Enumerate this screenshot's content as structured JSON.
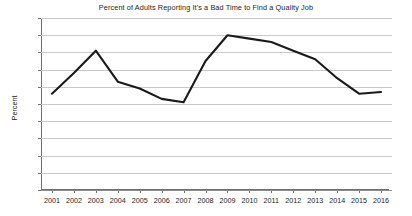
{
  "chart_data": {
    "type": "line",
    "title": "Percent of Adults Reporting It's a Bad Time to Find a Quality Job",
    "xlabel": "",
    "ylabel": "Percent",
    "categories": [
      "2001",
      "2002",
      "2003",
      "2004",
      "2005",
      "2006",
      "2007",
      "2008",
      "2009",
      "2010",
      "2011",
      "2012",
      "2013",
      "2014",
      "2015",
      "2016"
    ],
    "values": [
      56,
      68,
      81,
      63,
      59,
      53,
      51,
      75,
      90,
      88,
      86,
      81,
      76,
      65,
      56,
      57
    ],
    "series": [
      {
        "name": "Percent of Adults Reporting It's a Bad Time to Find a Quality Job",
        "values": [
          56,
          68,
          81,
          63,
          59,
          53,
          51,
          75,
          90,
          88,
          86,
          81,
          76,
          65,
          56,
          57
        ]
      }
    ],
    "ylim": [
      0,
      100
    ],
    "yticks": [
      0,
      10,
      20,
      30,
      40,
      50,
      60,
      70,
      80,
      90,
      100
    ],
    "ytick_labels": [
      "0",
      "10",
      "20",
      "30",
      "40",
      "50",
      "60",
      "70",
      "80",
      "90",
      "100"
    ],
    "grid": true,
    "legend": false,
    "legend_position": "none",
    "line_color": "#1a1a1a",
    "grid_color": "#c9c9c9",
    "background_color": "#ffffff"
  }
}
